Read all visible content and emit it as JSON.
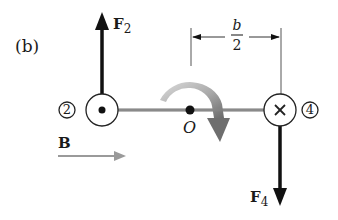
{
  "figure": {
    "panel_label": "(b)",
    "forces": [
      {
        "name": "F",
        "subscript": "2",
        "direction": "up",
        "wire": "2"
      },
      {
        "name": "F",
        "subscript": "4",
        "direction": "down",
        "wire": "4"
      }
    ],
    "wires": [
      {
        "number": "2",
        "current_symbol": "dot (out of page)"
      },
      {
        "number": "4",
        "current_symbol": "×",
        "current_label": "cross (into page)"
      }
    ],
    "pivot_label": "O",
    "dimension": {
      "numerator": "b",
      "denominator": "2"
    },
    "field_label": "B",
    "rotation": "clockwise",
    "colors": {
      "ink": "#111111",
      "bar": "#8a8a8a",
      "field_arrow": "#9a9a9a",
      "rotation_light": "#d0d0d0",
      "rotation_dark": "#707070"
    }
  }
}
